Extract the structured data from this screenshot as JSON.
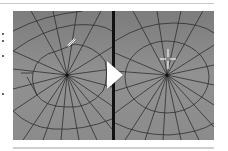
{
  "figure": {
    "panels": [
      {
        "name": "before",
        "label": "before",
        "tool": "knife-cursor"
      },
      {
        "name": "after",
        "label": "after",
        "tool": "crosshair-cursor"
      }
    ],
    "play_button": "play-arrow-icon",
    "colors": {
      "mesh_fill": "#8a8a8a",
      "edge": "#2e2e2e",
      "divider": "#111111",
      "arrow": "#ffffff"
    }
  }
}
